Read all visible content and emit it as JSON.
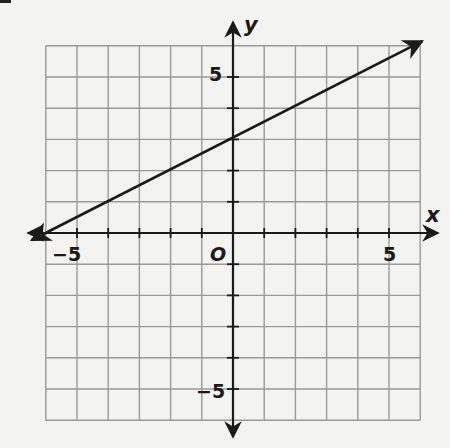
{
  "chart_data": {
    "type": "line",
    "title": "",
    "xlabel": "x",
    "ylabel": "y",
    "origin_label": "O",
    "xlim": [
      -6,
      6
    ],
    "ylim": [
      -6,
      6
    ],
    "grid": true,
    "grid_step": 1,
    "x_tick_labels": [
      {
        "value": -5,
        "label": "−5"
      },
      {
        "value": 5,
        "label": "5"
      }
    ],
    "y_tick_labels": [
      {
        "value": 5,
        "label": "5"
      },
      {
        "value": -5,
        "label": "−5"
      }
    ],
    "series": [
      {
        "name": "line",
        "equation": "y = 0.5x + 3",
        "slope": 0.5,
        "intercept": 3,
        "x": [
          -6,
          0,
          6
        ],
        "y": [
          0,
          3,
          6
        ],
        "arrows_both_ends": true
      }
    ],
    "colors": {
      "grid": "#9a9a9a",
      "axis": "#1a1a1a",
      "line": "#1a1a1a",
      "background": "#f3f3f1"
    }
  }
}
